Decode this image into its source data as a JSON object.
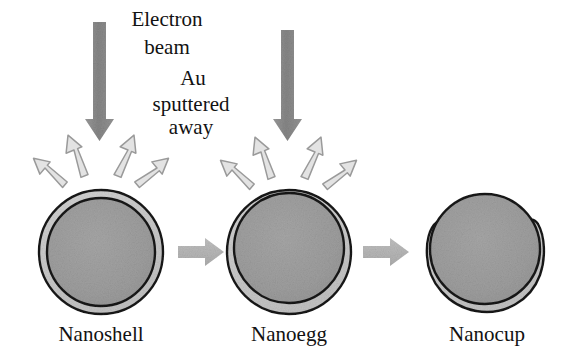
{
  "figure": {
    "background_color": "#ffffff"
  },
  "annotations": {
    "electron_beam_line1": "Electron",
    "electron_beam_line2": "beam",
    "au_sputtered_line1": "Au",
    "au_sputtered_line2": "sputtered",
    "au_sputtered_line3": "away"
  },
  "stages": [
    {
      "id": "nanoshell",
      "label": "Nanoshell",
      "description": "Silica core with concentric uniform gold shell",
      "core_offset_y": 0,
      "shell_uniform": true
    },
    {
      "id": "nanoegg",
      "label": "Nanoegg",
      "description": "Core displaced downward, shell thinned at top and thickened at bottom",
      "core_offset_y": 6,
      "shell_uniform": false
    },
    {
      "id": "nanocup",
      "label": "Nanocup",
      "description": "Shell sputtered off the top, remaining gold forms a cup with side horns",
      "core_offset_y": 10,
      "shell_uniform": false
    }
  ],
  "beams": [
    {
      "id": "beam-left",
      "target": "nanoshell"
    },
    {
      "id": "beam-right",
      "target": "nanoegg"
    }
  ],
  "sputter_arrow_counts": {
    "nanoshell": 4,
    "nanoegg": 4
  },
  "transitions": [
    {
      "id": "transition-1",
      "from": "Nanoshell",
      "to": "Nanoegg"
    },
    {
      "id": "transition-2",
      "from": "Nanoegg",
      "to": "Nanocup"
    }
  ],
  "colors": {
    "core_gray": "#9d9d9d",
    "shell_gray": "#c9c9c9",
    "outline_dark": "#1a1a1a",
    "beam_gray": "#8c8c8c",
    "sputter_fill": "#e3e3e3",
    "sputter_outline": "#9a9a9a",
    "transition_arrow": "#b5b5b5",
    "text_black": "#121212"
  }
}
